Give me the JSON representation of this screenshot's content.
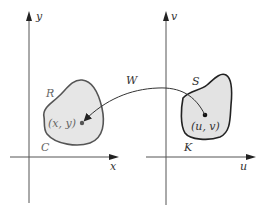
{
  "diagram": {
    "type": "coordinate transformation",
    "left_plane": {
      "x_axis_label": "x",
      "y_axis_label": "y",
      "region_label": "R",
      "boundary_label": "C",
      "point_label": "(x, y)"
    },
    "right_plane": {
      "x_axis_label": "u",
      "y_axis_label": "v",
      "region_label": "S",
      "boundary_label": "K",
      "point_label": "(u, v)"
    },
    "mapping": {
      "label": "W",
      "from": "(u, v)",
      "to": "(x, y)"
    },
    "colors": {
      "region_fill": "#e6e6e6",
      "axis": "#555555",
      "ink": "#333333"
    }
  }
}
